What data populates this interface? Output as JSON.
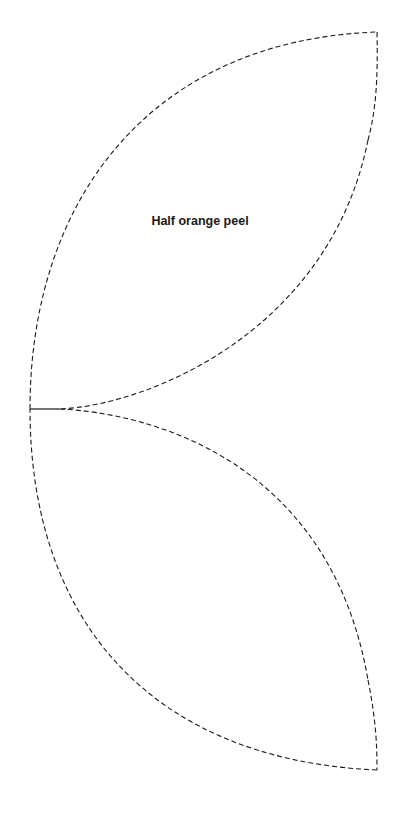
{
  "diagram": {
    "title": "Half orange peel",
    "line_color": "#1a1a1a",
    "background": "#ffffff",
    "lobes": [
      {
        "name": "upper-lobe",
        "outline": "dashed"
      },
      {
        "name": "lower-lobe",
        "outline": "dashed"
      }
    ],
    "join": {
      "name": "center-join",
      "outline": "solid"
    }
  }
}
